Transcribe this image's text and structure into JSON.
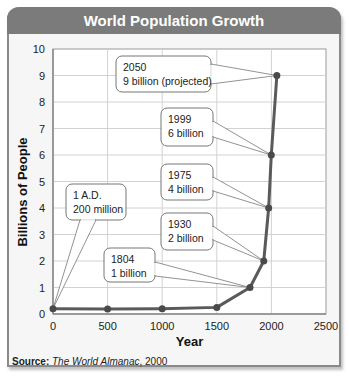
{
  "chart_data": {
    "type": "line",
    "title": "World Population Growth",
    "xlabel": "Year",
    "ylabel": "Billions of People",
    "xlim": [
      0,
      2500
    ],
    "ylim": [
      0,
      10
    ],
    "x_ticks": [
      "0",
      "500",
      "1000",
      "1500",
      "2000",
      "2500"
    ],
    "y_ticks": [
      "0",
      "1",
      "2",
      "3",
      "4",
      "5",
      "6",
      "7",
      "8",
      "9",
      "10"
    ],
    "grid": true,
    "series": [
      {
        "name": "World Population",
        "x": [
          0,
          500,
          1000,
          1500,
          1804,
          1930,
          1975,
          1999,
          2050
        ],
        "values": [
          0.2,
          0.19,
          0.2,
          0.25,
          1,
          2,
          4,
          6,
          9
        ]
      }
    ],
    "annotations": [
      {
        "line1": "1 A.D.",
        "line2": "200 million",
        "x": 0,
        "y": 0.2
      },
      {
        "line1": "1804",
        "line2": "1 billion",
        "x": 1804,
        "y": 1
      },
      {
        "line1": "1930",
        "line2": "2 billion",
        "x": 1930,
        "y": 2
      },
      {
        "line1": "1975",
        "line2": "4 billion",
        "x": 1975,
        "y": 4
      },
      {
        "line1": "1999",
        "line2": "6 billion",
        "x": 1999,
        "y": 6
      },
      {
        "line1": "2050",
        "line2": "9 billion (projected)",
        "x": 2050,
        "y": 9
      }
    ],
    "source_label": "Source:",
    "source_title": "The World Almanac",
    "source_year": ", 2000"
  }
}
